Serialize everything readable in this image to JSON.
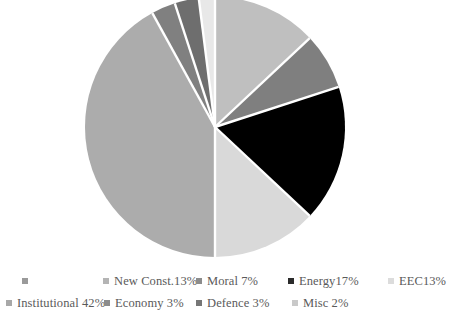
{
  "chart_data": {
    "type": "pie",
    "title": "",
    "subtitle": "",
    "xlabel": "",
    "ylabel": "",
    "grid": false,
    "legend_position": "bottom",
    "start_angle_deg": 0,
    "direction": "clockwise",
    "slice_separator_color": "#ffffff",
    "categories": [
      "New Const.",
      "Moral",
      "Energy",
      "EEC",
      "Institutional",
      "Economy",
      "Defence",
      "Misc"
    ],
    "values": [
      13,
      7,
      17,
      13,
      42,
      3,
      3,
      2
    ],
    "units": "percent",
    "colors": [
      "#bfbfbf",
      "#7f7f7f",
      "#000000",
      "#d9d9d9",
      "#acacac",
      "#808080",
      "#6e6e6e",
      "#e8e8e8"
    ],
    "slices": [
      {
        "label": "New Const.",
        "value": 13,
        "display": "New Const.13%",
        "color": "#bfbfbf"
      },
      {
        "label": "Moral",
        "value": 7,
        "display": "Moral 7%",
        "color": "#7f7f7f"
      },
      {
        "label": "Energy",
        "value": 17,
        "display": "Energy17%",
        "color": "#000000"
      },
      {
        "label": "EEC",
        "value": 13,
        "display": "EEC13%",
        "color": "#d9d9d9"
      },
      {
        "label": "Institutional",
        "value": 42,
        "display": "Institutional 42%",
        "color": "#acacac"
      },
      {
        "label": "Economy",
        "value": 3,
        "display": "Economy 3%",
        "color": "#808080"
      },
      {
        "label": "Defence",
        "value": 3,
        "display": "Defence 3%",
        "color": "#6e6e6e"
      },
      {
        "label": "Misc",
        "value": 2,
        "display": "Misc 2%",
        "color": "#e8e8e8"
      }
    ]
  },
  "pie": {
    "center_x": 215,
    "center_y": 127,
    "radius": 130
  },
  "legend": {
    "rows": [
      {
        "items": [
          {
            "label": "",
            "color": "#9a9a9a",
            "x": 22
          },
          {
            "label": "New Const.13%",
            "color": "#b4b4b4",
            "x": 103
          },
          {
            "label": "Moral 7%",
            "color": "#8c8c8c",
            "x": 196
          },
          {
            "label": "Energy17%",
            "color": "#2b2b2b",
            "x": 288
          },
          {
            "label": "EEC13%",
            "color": "#dcdcdc",
            "x": 388
          }
        ]
      },
      {
        "items": [
          {
            "label": "Institutional 42%",
            "color": "#a8a8a8",
            "x": 6
          },
          {
            "label": "Economy 3%",
            "color": "#8c8c8c",
            "x": 104
          },
          {
            "label": "Defence 3%",
            "color": "#767676",
            "x": 196
          },
          {
            "label": "Misc 2%",
            "color": "#c9c9c9",
            "x": 292
          }
        ]
      }
    ]
  }
}
